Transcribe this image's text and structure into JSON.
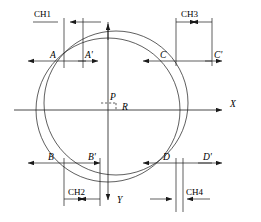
{
  "diagram": {
    "axes": {
      "x_label": "X",
      "y_label": "Y"
    },
    "center": {
      "point_label": "P",
      "radius_label": "R"
    },
    "points": {
      "a": "A",
      "a_prime": "A'",
      "c": "C",
      "c_prime": "C'",
      "b": "B",
      "b_prime": "B'",
      "d": "D",
      "d_prime": "D'"
    },
    "dimensions": {
      "ch1": "CH1",
      "ch2": "CH2",
      "ch3": "CH3",
      "ch4": "CH4"
    },
    "colors": {
      "line": "#1a1a1a",
      "background": "#ffffff"
    }
  }
}
